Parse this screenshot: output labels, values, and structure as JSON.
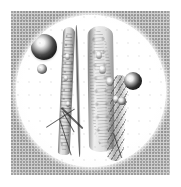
{
  "figure": {
    "caption": "",
    "domain_description": "photomicrograph illustration",
    "canvas": {
      "width": 181,
      "height": 187,
      "background_color": "#ffffff"
    },
    "plate": {
      "name": "halftone-gray-plate",
      "left": 11,
      "top": 11,
      "width": 159,
      "height": 164,
      "color": "#cfcfcf",
      "texture": "stippled halftone dots"
    },
    "field_of_view": {
      "name": "circular-microscope-field",
      "shape": "circle",
      "left": 16,
      "top": 15,
      "width": 150,
      "height": 152,
      "color": "#ffffff"
    },
    "specimen": {
      "label": "elongated fibers",
      "elements": [
        {
          "name": "left-straight-fiber",
          "kind": "fiber",
          "orientation": "vertical"
        },
        {
          "name": "thin-hair-fiber",
          "kind": "fiber",
          "orientation": "vertical"
        },
        {
          "name": "right-curved-fiber-bundle",
          "kind": "fiber-bundle",
          "orientation": "vertical-curved"
        },
        {
          "name": "twisted-strand",
          "kind": "fiber",
          "orientation": "diagonal-twisted"
        },
        {
          "name": "branching-strands",
          "kind": "strands",
          "orientation": "oblique"
        }
      ],
      "nuclei_count": 7
    },
    "droplets": [
      {
        "name": "droplet-large-upper-left",
        "size": "large",
        "cx": 44,
        "cy": 47,
        "r": 13
      },
      {
        "name": "droplet-small-left",
        "size": "small",
        "cx": 42,
        "cy": 69,
        "r": 5
      },
      {
        "name": "droplet-medium-right",
        "size": "medium",
        "cx": 133,
        "cy": 80,
        "r": 9
      },
      {
        "name": "droplet-small-right",
        "size": "small",
        "cx": 122,
        "cy": 101,
        "r": 4
      }
    ],
    "colors": {
      "paper": "#ffffff",
      "plate_gray": "#cfcfcf",
      "field_white": "#fdfdfd",
      "ink_dark": "#1c1c1c",
      "fiber_gray": "#6e6e6e"
    }
  }
}
